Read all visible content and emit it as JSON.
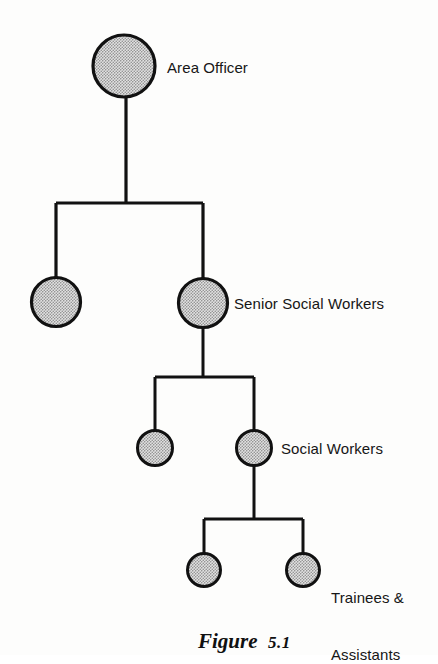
{
  "figure": {
    "caption_word": "Figure",
    "caption_number": "5.1"
  },
  "diagram": {
    "type": "organisation-hierarchy-tree",
    "node_fill": "#cfcfcf",
    "node_stroke": "#111111",
    "line_color": "#111111",
    "background": "#fdfdfc",
    "levels": [
      {
        "level": 1,
        "label": "Area Officer",
        "label_x": 168,
        "label_y": 67,
        "nodes": [
          {
            "cx": 124,
            "cy": 66,
            "r": 32
          }
        ]
      },
      {
        "level": 2,
        "label": "Senior Social Workers",
        "label_x": 234,
        "label_y": 303,
        "nodes": [
          {
            "cx": 56,
            "cy": 302,
            "r": 25
          },
          {
            "cx": 203,
            "cy": 303,
            "r": 25
          }
        ]
      },
      {
        "level": 3,
        "label": "Social Workers",
        "label_x": 281,
        "label_y": 448,
        "nodes": [
          {
            "cx": 155,
            "cy": 448,
            "r": 18
          },
          {
            "cx": 254,
            "cy": 448,
            "r": 18
          }
        ]
      },
      {
        "level": 4,
        "label_line1": "Trainees &",
        "label_line2": "Assistants",
        "label_x": 331,
        "label_y": 560,
        "nodes": [
          {
            "cx": 204,
            "cy": 570,
            "r": 17
          },
          {
            "cx": 303,
            "cy": 570,
            "r": 17
          }
        ]
      }
    ],
    "connectors": [
      {
        "from": "Area Officer",
        "to": "Senior Social Workers",
        "stem_x": 126,
        "stem_top": 98,
        "bar_y": 203,
        "bar_left": 56,
        "bar_right": 203
      },
      {
        "from": "Senior Social Workers",
        "to": "Social Workers",
        "stem_x": 203,
        "stem_top": 328,
        "bar_y": 377,
        "bar_left": 155,
        "bar_right": 254
      },
      {
        "from": "Social Workers",
        "to": "Trainees & Assistants",
        "stem_x": 254,
        "stem_top": 466,
        "bar_y": 519,
        "bar_left": 204,
        "bar_right": 303
      }
    ]
  }
}
